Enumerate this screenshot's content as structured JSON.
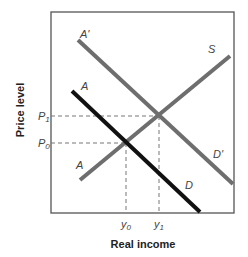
{
  "diagram": {
    "type": "aggregate-demand-supply",
    "x_axis_label": "Real income",
    "y_axis_label": "Price level",
    "y_ticks": [
      {
        "label": "P",
        "sub": "1",
        "y": 116
      },
      {
        "label": "P",
        "sub": "0",
        "y": 143
      }
    ],
    "x_ticks": [
      {
        "label": "y",
        "sub": "0",
        "x": 126
      },
      {
        "label": "y",
        "sub": "1",
        "x": 159
      }
    ],
    "curves": [
      {
        "name": "AD-shifted",
        "start_label": "A'",
        "end_label": "D'",
        "color": "#6e6e6e",
        "x1": 78,
        "y1": 40,
        "x2": 233,
        "y2": 184
      },
      {
        "name": "AD",
        "start_label": "A",
        "end_label": "D",
        "color": "#111111",
        "x1": 72,
        "y1": 91,
        "x2": 200,
        "y2": 212
      },
      {
        "name": "AS",
        "start_label": "A",
        "end_label": "S",
        "color": "#6e6e6e",
        "x1": 80,
        "y1": 180,
        "x2": 230,
        "y2": 56
      }
    ],
    "labels": {
      "a_prime": "A'",
      "d_prime": "D'",
      "a_demand": "A",
      "d": "D",
      "a_supply": "A",
      "s": "S",
      "p1": "P",
      "p1_sub": "1",
      "p0": "P",
      "p0_sub": "0",
      "y0": "y",
      "y0_sub": "0",
      "y1": "y",
      "y1_sub": "1"
    }
  }
}
